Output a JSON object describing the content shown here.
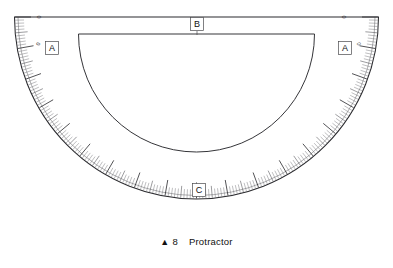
{
  "figure": {
    "name": "protractor-diagram",
    "outer_edge_color": "#2a2a2e",
    "tick_color": "#5c5c61"
  },
  "callouts": [
    {
      "id": "A-left",
      "label": "A",
      "x": 52,
      "y": 48
    },
    {
      "id": "A-right",
      "label": "A",
      "x": 345,
      "y": 48
    },
    {
      "id": "B",
      "label": "B",
      "x": 197,
      "y": 24
    },
    {
      "id": "C",
      "label": "C",
      "x": 199,
      "y": 190
    }
  ],
  "scale": {
    "zero_left_label": "0",
    "zero_right_label": "0",
    "outer_labels": [
      0,
      10,
      20,
      30,
      40,
      50,
      60,
      70,
      80,
      90,
      100,
      110,
      120,
      130,
      140,
      150,
      160,
      170,
      180
    ],
    "inner_labels": [
      180,
      170,
      160,
      150,
      140,
      130,
      120,
      110,
      100,
      90,
      80,
      70,
      60,
      50,
      40,
      30,
      20,
      10,
      0
    ],
    "major_step_deg": 10,
    "medium_step_deg": 5,
    "fine_step_deg": 1,
    "range_deg": [
      0,
      180
    ]
  },
  "caption": {
    "marker": "▲",
    "number": "8",
    "text": "Protractor"
  }
}
